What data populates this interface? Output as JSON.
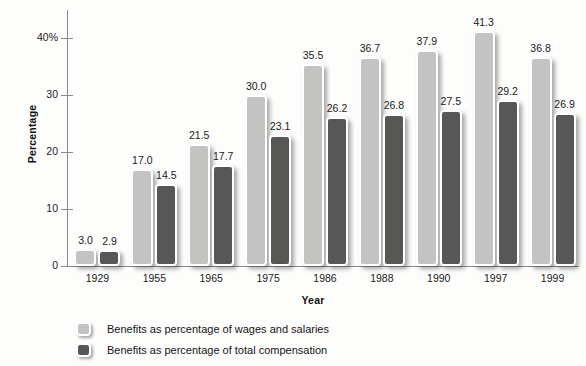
{
  "chart_data": {
    "type": "bar",
    "title": "",
    "xlabel": "Year",
    "ylabel": "Percentage",
    "ylim": [
      0,
      45
    ],
    "yticks": [
      0,
      10,
      20,
      30,
      40
    ],
    "ytick_labels": [
      "0",
      "10",
      "20",
      "30",
      "40%"
    ],
    "grid": false,
    "legend_position": "bottom-left",
    "categories": [
      "1929",
      "1955",
      "1965",
      "1975",
      "1986",
      "1988",
      "1990",
      "1997",
      "1999"
    ],
    "series": [
      {
        "name": "Benefits as percentage of wages and salaries",
        "color": "#c3c3c1",
        "values": [
          3.0,
          17.0,
          21.5,
          30.0,
          35.5,
          36.7,
          37.9,
          41.3,
          36.8
        ],
        "labels": [
          "3.0",
          "17.0",
          "21.5",
          "30.0",
          "35.5",
          "36.7",
          "37.9",
          "41.3",
          "36.8"
        ]
      },
      {
        "name": "Benefits as percentage of total compensation",
        "color": "#575756",
        "values": [
          2.9,
          14.5,
          17.7,
          23.1,
          26.2,
          26.8,
          27.5,
          29.2,
          26.9
        ],
        "labels": [
          "2.9",
          "14.5",
          "17.7",
          "23.1",
          "26.2",
          "26.8",
          "27.5",
          "29.2",
          "26.9"
        ]
      }
    ]
  },
  "legend": {
    "items": [
      {
        "label": "Benefits as percentage of wages and salaries",
        "swatch": "light"
      },
      {
        "label": "Benefits as percentage of total compensation",
        "swatch": "dark"
      }
    ]
  }
}
